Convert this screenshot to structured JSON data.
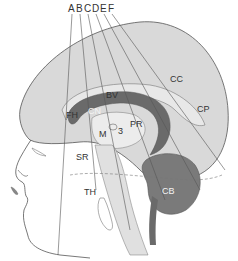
{
  "diagram": {
    "scan_lines": [
      "A",
      "B",
      "C",
      "D",
      "E",
      "F"
    ],
    "structure_labels": {
      "cc": "CC",
      "cp": "CP",
      "bv": "BV",
      "fh": "FH",
      "cn": "CN",
      "pr": "PR",
      "m": "M",
      "third": "3",
      "sr": "SR",
      "th": "TH",
      "cb": "CB"
    },
    "colors": {
      "brain_fill": "#d9d9d9",
      "ventricle_dark": "#6a6a6a",
      "cerebellum": "#7a7a7a",
      "outline": "#555555",
      "lip": "#888888"
    }
  }
}
